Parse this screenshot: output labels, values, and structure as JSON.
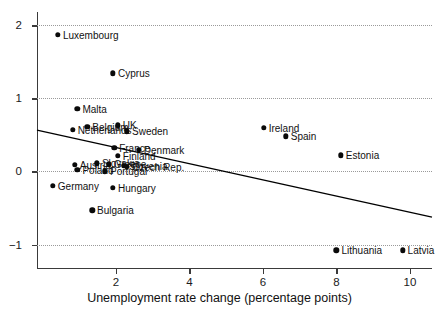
{
  "chart_data": {
    "type": "scatter",
    "title": "",
    "xlabel": "Unemployment rate change (percentage points)",
    "ylabel": "",
    "xlim": [
      -0.15,
      10.6
    ],
    "ylim": [
      -1.32,
      2.18
    ],
    "xticks": [
      2,
      4,
      6,
      8,
      10
    ],
    "xticklabels": [
      "2",
      "4",
      "6",
      "8",
      "10"
    ],
    "yticks": [
      -1,
      0,
      1,
      2
    ],
    "yticklabels": [
      "−1",
      "0",
      "1",
      "2"
    ],
    "grid": "horizontal-dotted",
    "legend": "none",
    "points": [
      {
        "label": "Luxembourg",
        "x": 0.42,
        "y": 1.87,
        "label_side": "right"
      },
      {
        "label": "Cyprus",
        "x": 1.92,
        "y": 1.34,
        "label_side": "right"
      },
      {
        "label": "Malta",
        "x": 0.95,
        "y": 0.86,
        "label_side": "right"
      },
      {
        "label": "Netherlands",
        "x": 0.82,
        "y": 0.57,
        "label_side": "right"
      },
      {
        "label": "Belgium",
        "x": 1.22,
        "y": 0.61,
        "label_side": "right"
      },
      {
        "label": "UK",
        "x": 2.05,
        "y": 0.63,
        "label_side": "right"
      },
      {
        "label": "Sweden",
        "x": 2.3,
        "y": 0.55,
        "label_side": "right"
      },
      {
        "label": "France",
        "x": 1.95,
        "y": 0.32,
        "label_side": "right"
      },
      {
        "label": "Denmark",
        "x": 2.62,
        "y": 0.3,
        "label_side": "right"
      },
      {
        "label": "Finland",
        "x": 2.05,
        "y": 0.21,
        "label_side": "right"
      },
      {
        "label": "Austria",
        "x": 0.88,
        "y": 0.09,
        "label_side": "right"
      },
      {
        "label": "Poland",
        "x": 0.95,
        "y": 0.02,
        "label_side": "right"
      },
      {
        "label": "Slovakia",
        "x": 1.48,
        "y": 0.11,
        "label_side": "right"
      },
      {
        "label": "Greece",
        "x": 1.8,
        "y": 0.1,
        "label_side": "right"
      },
      {
        "label": "Slovenia",
        "x": 2.22,
        "y": 0.08,
        "label_side": "right"
      },
      {
        "label": "Czech Rep.",
        "x": 2.3,
        "y": 0.06,
        "label_side": "right"
      },
      {
        "label": "Portugal",
        "x": 1.7,
        "y": 0.0,
        "label_side": "right"
      },
      {
        "label": "Germany",
        "x": 0.28,
        "y": -0.2,
        "label_side": "right"
      },
      {
        "label": "Hungary",
        "x": 1.92,
        "y": -0.22,
        "label_side": "right"
      },
      {
        "label": "Bulgaria",
        "x": 1.35,
        "y": -0.53,
        "label_side": "right"
      },
      {
        "label": "Ireland",
        "x": 6.02,
        "y": 0.6,
        "label_side": "right"
      },
      {
        "label": "Spain",
        "x": 6.62,
        "y": 0.48,
        "label_side": "right"
      },
      {
        "label": "Estonia",
        "x": 8.12,
        "y": 0.22,
        "label_side": "right"
      },
      {
        "label": "Lithuania",
        "x": 8.0,
        "y": -1.08,
        "label_side": "right"
      },
      {
        "label": "Latvia",
        "x": 9.8,
        "y": -1.08,
        "label_side": "right"
      }
    ],
    "fit_line": {
      "x0": -0.15,
      "y0": 0.565,
      "x1": 10.6,
      "y1": -0.625,
      "color": "#000000"
    }
  }
}
